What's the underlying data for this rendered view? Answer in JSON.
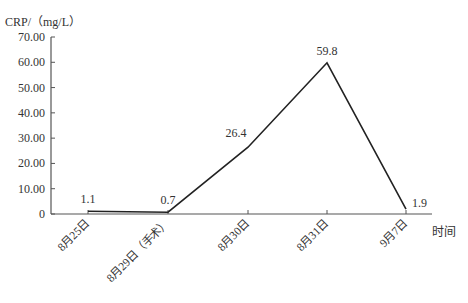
{
  "chart_data": {
    "type": "line",
    "title": "",
    "ylabel": "CRP/（mg/L）",
    "xlabel": "时间",
    "categories": [
      "8月25日",
      "8月29日（手术）",
      "8月30日",
      "8月31日",
      "9月7日"
    ],
    "series": [
      {
        "name": "CRP",
        "values": [
          1.1,
          0.7,
          26.4,
          59.8,
          1.9
        ]
      }
    ],
    "data_labels": [
      "1.1",
      "0.7",
      "26.4",
      "59.8",
      "1.9"
    ],
    "y_ticks": [
      "0",
      "10.00",
      "20.00",
      "30.00",
      "40.00",
      "50.00",
      "60.00",
      "70.00"
    ],
    "ylim": [
      0,
      70
    ],
    "grid": false,
    "legend": "none",
    "line_color": "#222222"
  }
}
